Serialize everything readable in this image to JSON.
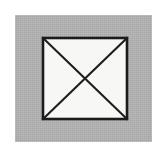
{
  "figure": {
    "canvas": {
      "width": 168,
      "height": 149,
      "background_color": "#ffffff"
    },
    "panel": {
      "label": "gray background plate",
      "x": 15,
      "y": 15,
      "width": 137,
      "height": 127,
      "fill_color": "#b3b3b3"
    },
    "square": {
      "label": "square outline",
      "x": 43,
      "y": 38,
      "width": 84,
      "height": 81,
      "fill_color": "#f7f7f5",
      "stroke_color": "#1b1b1b",
      "stroke_width": 2.6
    },
    "diagonals": [
      {
        "label": "diagonal top-left to bottom-right",
        "x1": 43,
        "y1": 38,
        "x2": 127,
        "y2": 119,
        "stroke_color": "#1e1e1e",
        "stroke_width": 2.1
      },
      {
        "label": "diagonal top-right to bottom-left",
        "x1": 127,
        "y1": 38,
        "x2": 43,
        "y2": 119,
        "stroke_color": "#1e1e1e",
        "stroke_width": 2.1
      }
    ],
    "intersection": {
      "label": "diagonal crossing point",
      "x": 85,
      "y": 78
    }
  }
}
